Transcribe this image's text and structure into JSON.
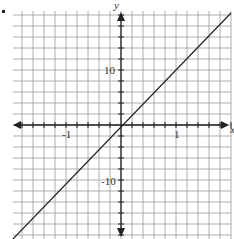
{
  "chart_data": {
    "type": "line",
    "title": "",
    "xlabel": "x",
    "ylabel": "y",
    "xlim": [
      -2.0,
      2.0
    ],
    "ylim": [
      -20,
      22
    ],
    "grid": true,
    "grid_step": {
      "x": 0.2,
      "y": 2
    },
    "x_tick_labels": [
      "-1",
      "1"
    ],
    "y_tick_labels": [
      "10",
      "-10"
    ],
    "series": [
      {
        "name": "y = 10x",
        "x": [
          -2.0,
          -1,
          0,
          1,
          2.0
        ],
        "values": [
          -20,
          -10,
          0,
          10,
          20
        ]
      }
    ],
    "colors": {
      "grid": "#9a9a9a",
      "axis": "#222222",
      "line": "#222222"
    }
  },
  "labels": {
    "y_axis": "y",
    "x_axis": "x",
    "y_pos": "10",
    "y_neg": "-10",
    "x_neg": "-1",
    "x_pos": "1"
  }
}
